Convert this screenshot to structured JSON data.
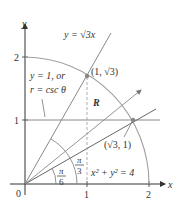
{
  "axes": {
    "x_label": "x",
    "y_label": "y",
    "origin_label": "0",
    "x_ticks": [
      "1",
      "2"
    ],
    "y_ticks": [
      "1",
      "2"
    ]
  },
  "curves": {
    "line_sqrt3x": "y = √3x",
    "horizontal_line_a": "y = 1, or",
    "horizontal_line_b": "r = csc θ",
    "circle": "x² + y² = 4"
  },
  "points": {
    "p1": "(1, √3)",
    "p2": "(√3, 1)"
  },
  "region_label": "R",
  "angles": {
    "pi6_num": "π",
    "pi6_den": "6",
    "pi3_num": "π",
    "pi3_den": "3"
  },
  "colors": {
    "axis": "#333333",
    "line": "#8a8a8a",
    "circle": "#a0a0a0",
    "dashed": "#9a9a9a"
  }
}
